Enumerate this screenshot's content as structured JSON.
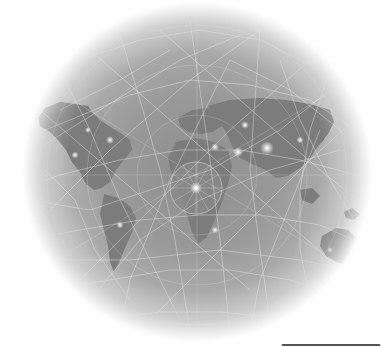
{
  "illustration": {
    "subject": "world map on globe with network mesh",
    "palette": {
      "background": "#ffffff",
      "globe_mid": "#999999",
      "land": "#7a7a7a",
      "mesh": "#f2f2f2",
      "hub_glow": "#ffffff",
      "scale_line": "#555555"
    },
    "continents": [
      "north-america",
      "south-america",
      "europe",
      "africa",
      "asia",
      "australia"
    ],
    "hubs": [
      {
        "x": 196,
        "y": 188
      },
      {
        "x": 267,
        "y": 148
      },
      {
        "x": 238,
        "y": 152
      },
      {
        "x": 215,
        "y": 147
      },
      {
        "x": 245,
        "y": 125
      },
      {
        "x": 110,
        "y": 140
      },
      {
        "x": 75,
        "y": 155
      },
      {
        "x": 300,
        "y": 140
      },
      {
        "x": 120,
        "y": 225
      },
      {
        "x": 215,
        "y": 230
      }
    ]
  }
}
